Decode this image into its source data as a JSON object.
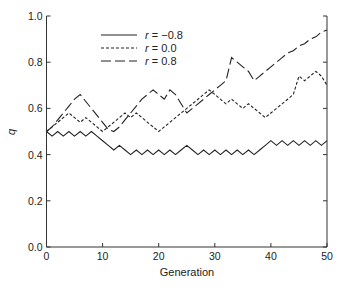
{
  "chart_data": {
    "type": "line",
    "title": "",
    "xlabel": "Generation",
    "ylabel": "q",
    "xlim": [
      0,
      50
    ],
    "ylim": [
      0.0,
      1.0
    ],
    "grid": false,
    "legend_position": "upper-left-inside",
    "x_ticks": [
      "0",
      "10",
      "20",
      "30",
      "40",
      "50"
    ],
    "y_ticks": [
      "0.0",
      "0.2",
      "0.4",
      "0.6",
      "0.8",
      "1.0"
    ],
    "x": [
      0,
      1,
      2,
      3,
      4,
      5,
      6,
      7,
      8,
      9,
      10,
      11,
      12,
      13,
      14,
      15,
      16,
      17,
      18,
      19,
      20,
      21,
      22,
      23,
      24,
      25,
      26,
      27,
      28,
      29,
      30,
      31,
      32,
      33,
      34,
      35,
      36,
      37,
      38,
      39,
      40,
      41,
      42,
      43,
      44,
      45,
      46,
      47,
      48,
      49,
      50
    ],
    "series": [
      {
        "name": "r = -0.8",
        "legend_var": "r",
        "legend_value": "= −0.8",
        "style": "solid",
        "values": [
          0.5,
          0.48,
          0.5,
          0.48,
          0.5,
          0.48,
          0.5,
          0.48,
          0.5,
          0.48,
          0.46,
          0.44,
          0.42,
          0.44,
          0.42,
          0.4,
          0.42,
          0.4,
          0.42,
          0.4,
          0.42,
          0.4,
          0.42,
          0.4,
          0.42,
          0.44,
          0.42,
          0.4,
          0.42,
          0.4,
          0.42,
          0.4,
          0.42,
          0.4,
          0.42,
          0.4,
          0.42,
          0.4,
          0.42,
          0.44,
          0.46,
          0.44,
          0.46,
          0.44,
          0.46,
          0.44,
          0.46,
          0.44,
          0.46,
          0.44,
          0.46
        ]
      },
      {
        "name": "r = 0.0",
        "legend_var": "r",
        "legend_value": "= 0.0",
        "style": "short-dash",
        "values": [
          0.5,
          0.52,
          0.54,
          0.56,
          0.58,
          0.56,
          0.54,
          0.56,
          0.54,
          0.52,
          0.5,
          0.52,
          0.54,
          0.56,
          0.58,
          0.56,
          0.58,
          0.56,
          0.54,
          0.52,
          0.5,
          0.52,
          0.54,
          0.56,
          0.58,
          0.6,
          0.62,
          0.64,
          0.66,
          0.68,
          0.66,
          0.64,
          0.62,
          0.64,
          0.62,
          0.6,
          0.62,
          0.6,
          0.58,
          0.56,
          0.58,
          0.6,
          0.62,
          0.64,
          0.66,
          0.74,
          0.72,
          0.74,
          0.76,
          0.74,
          0.7
        ]
      },
      {
        "name": "r = 0.8",
        "legend_var": "r",
        "legend_value": "= 0.8",
        "style": "long-dash",
        "values": [
          0.5,
          0.52,
          0.55,
          0.58,
          0.61,
          0.64,
          0.66,
          0.63,
          0.6,
          0.57,
          0.54,
          0.51,
          0.5,
          0.52,
          0.55,
          0.58,
          0.61,
          0.64,
          0.66,
          0.68,
          0.66,
          0.64,
          0.68,
          0.66,
          0.62,
          0.58,
          0.6,
          0.62,
          0.64,
          0.66,
          0.68,
          0.7,
          0.72,
          0.82,
          0.8,
          0.78,
          0.76,
          0.72,
          0.74,
          0.76,
          0.78,
          0.8,
          0.82,
          0.84,
          0.85,
          0.87,
          0.88,
          0.9,
          0.91,
          0.93,
          0.94
        ]
      }
    ]
  }
}
